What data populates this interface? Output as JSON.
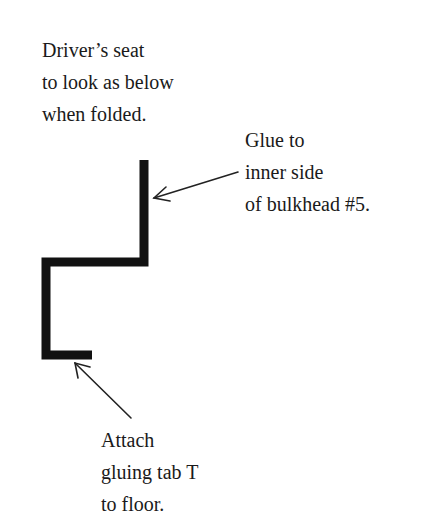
{
  "labels": {
    "seat_note": {
      "lines": [
        "Driver’s seat",
        "to look as below",
        "when folded."
      ]
    },
    "glue_note": {
      "lines": [
        "Glue to",
        "inner side",
        "of bulkhead #5."
      ]
    },
    "attach_note": {
      "lines": [
        "Attach",
        "gluing tab T",
        "to floor."
      ]
    }
  },
  "colors": {
    "ink": "#1a1a1a",
    "background": "#ffffff"
  }
}
